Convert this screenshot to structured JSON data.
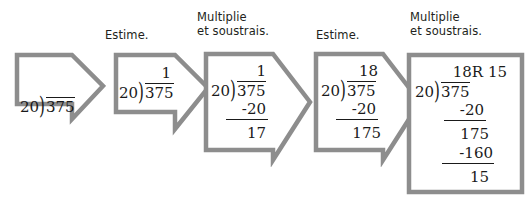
{
  "diagram": {
    "title_visible": false,
    "colors": {
      "shape_outline": "#8d8d8d",
      "shape_fill": "#ffffff",
      "text": "#1a1a1a",
      "caption_text": "#231f20",
      "background": "#ffffff"
    },
    "problem": {
      "dividend": "375",
      "divisor": "20",
      "quotient": "18",
      "remainder": "15",
      "answer": "18R 15"
    },
    "steps": [
      {
        "id": "step-1",
        "caption": "",
        "shape": "arrow",
        "quotient": "",
        "divisor": "20",
        "dividend": "375",
        "lines": []
      },
      {
        "id": "step-2",
        "caption": "Estime.",
        "shape": "arrow",
        "quotient": "1",
        "divisor": "20",
        "dividend": "375",
        "lines": []
      },
      {
        "id": "step-3",
        "caption": "Multiplie\net soustrais.",
        "shape": "arrow",
        "quotient": "1",
        "divisor": "20",
        "dividend": "375",
        "lines": [
          "-20",
          "17"
        ]
      },
      {
        "id": "step-4",
        "caption": "Estime.",
        "shape": "arrow",
        "quotient": "18",
        "divisor": "20",
        "dividend": "375",
        "lines": [
          "-20",
          "175"
        ]
      },
      {
        "id": "step-5",
        "caption": "Multiplie\net soustrais.",
        "shape": "box",
        "quotient": "18R 15",
        "divisor": "20",
        "dividend": "375",
        "lines": [
          "-20",
          "175",
          "-160",
          "15"
        ]
      }
    ]
  }
}
